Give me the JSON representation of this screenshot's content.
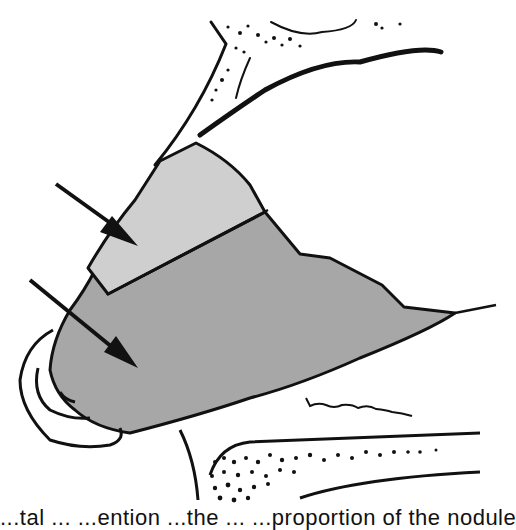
{
  "figure": {
    "type": "anatomical-illustration",
    "colors": {
      "background": "#ffffff",
      "stroke": "#111111",
      "upper_region_fill": "#cfcfcf",
      "lower_region_fill": "#a7a7a7"
    },
    "regions": [
      {
        "id": "upper-region",
        "shade": "light gray",
        "arrow": "upper-arrow"
      },
      {
        "id": "lower-region",
        "shade": "medium gray",
        "arrow": "lower-arrow"
      }
    ],
    "arrows": [
      {
        "id": "upper-arrow",
        "points_to": "upper-region"
      },
      {
        "id": "lower-arrow",
        "points_to": "lower-region"
      }
    ]
  },
  "caption": {
    "text": "...tal ... ...ention ...the ... ...proportion of the nodule",
    "clipped": true
  }
}
